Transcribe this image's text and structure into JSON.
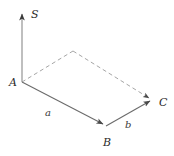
{
  "figure": {
    "type": "vector-parallelogram-diagram",
    "background_color": "#ffffff",
    "stroke_color": "#6b6b6b",
    "dashed_stroke_color": "#9a9a9a",
    "text_color": "#2b2b2b",
    "width": 174,
    "height": 156,
    "vertices": [
      {
        "name": "A",
        "label": "A",
        "x": 22,
        "y": 82,
        "label_x": 9,
        "label_y": 77
      },
      {
        "name": "B",
        "label": "B",
        "x": 106,
        "y": 126,
        "label_x": 103,
        "label_y": 137
      },
      {
        "name": "C",
        "label": "C",
        "x": 152,
        "y": 100,
        "label_x": 159,
        "label_y": 97
      },
      {
        "name": "D",
        "label": "",
        "x": 73,
        "y": 51,
        "label_x": 73,
        "label_y": 44
      }
    ],
    "axis": {
      "name": "S",
      "label": "S",
      "label_x": 31,
      "label_y": 9,
      "from_x": 22,
      "from_y": 82,
      "to_x": 22,
      "to_y": 12
    },
    "edges": [
      {
        "name": "edge-A-B",
        "style": "solid",
        "arrow": true,
        "from": "A",
        "to": "B"
      },
      {
        "name": "edge-B-C",
        "style": "solid",
        "arrow": true,
        "from": "B",
        "to": "C"
      },
      {
        "name": "edge-A-D",
        "style": "dashed",
        "arrow": false,
        "from": "A",
        "to": "D"
      },
      {
        "name": "edge-D-C",
        "style": "dashed",
        "arrow": true,
        "from": "D",
        "to": "C"
      }
    ],
    "side_labels": [
      {
        "name": "a",
        "label": "a",
        "x": 45,
        "y": 108
      },
      {
        "name": "b",
        "label": "b",
        "x": 125,
        "y": 120
      }
    ]
  }
}
